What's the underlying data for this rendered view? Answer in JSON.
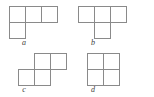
{
  "figure": {
    "background_color": "#ffffff",
    "stroke_color": "#8a8a8a",
    "label_color": "#3d3d3d",
    "cell_size_px": 17,
    "shapes": [
      {
        "id": "shape-a",
        "label": "a",
        "name": "j-tetromino",
        "origin_x": 9,
        "origin_y": 6,
        "label_x": 24,
        "label_y": 39,
        "cells": [
          {
            "col": 0,
            "row": 0
          },
          {
            "col": 1,
            "row": 0
          },
          {
            "col": 2,
            "row": 0
          },
          {
            "col": 0,
            "row": 1
          }
        ]
      },
      {
        "id": "shape-b",
        "label": "b",
        "name": "t-tetromino",
        "origin_x": 78,
        "origin_y": 6,
        "label_x": 93,
        "label_y": 39,
        "cells": [
          {
            "col": 0,
            "row": 0
          },
          {
            "col": 1,
            "row": 0
          },
          {
            "col": 2,
            "row": 0
          },
          {
            "col": 1,
            "row": 1
          }
        ]
      },
      {
        "id": "shape-c",
        "label": "c",
        "name": "s-tetromino",
        "origin_x": 18,
        "origin_y": 53,
        "label_x": 24,
        "label_y": 86,
        "cells": [
          {
            "col": 1,
            "row": 0
          },
          {
            "col": 2,
            "row": 0
          },
          {
            "col": 0,
            "row": 1
          },
          {
            "col": 1,
            "row": 1
          }
        ]
      },
      {
        "id": "shape-d",
        "label": "d",
        "name": "o-tetromino",
        "origin_x": 87,
        "origin_y": 53,
        "label_x": 93,
        "label_y": 86,
        "cells": [
          {
            "col": 0,
            "row": 0
          },
          {
            "col": 1,
            "row": 0
          },
          {
            "col": 0,
            "row": 1
          },
          {
            "col": 1,
            "row": 1
          }
        ]
      }
    ]
  }
}
